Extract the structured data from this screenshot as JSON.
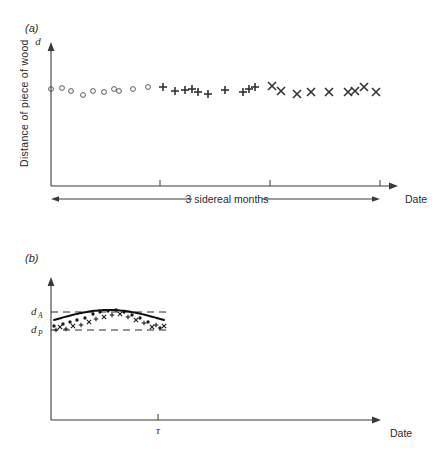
{
  "figure": {
    "background": "#ffffff",
    "ink_color": "#2b2b2b",
    "panel_a_tag": "(a)",
    "panel_b_tag": "(b)"
  },
  "panel_a": {
    "y_axis_symbol": "d",
    "y_axis_label": "Distance of piece of wood",
    "x_axis_label": "Date",
    "span_label": "3 sidereal months",
    "tick_count": 3
  },
  "panel_b": {
    "x_axis_label": "Date",
    "tau_label": "τ",
    "level_high_symbol": "d",
    "level_high_sub": "A",
    "level_low_symbol": "d",
    "level_low_sub": "P"
  },
  "chart_data": [
    {
      "type": "scatter",
      "panel": "(a)",
      "title": "",
      "xlabel": "Date",
      "ylabel": "Distance of piece of wood",
      "y_axis_symbol": "d",
      "grid": false,
      "legend": "none",
      "axis_note": "3 sidereal months",
      "xlim": [
        0,
        100
      ],
      "ylim": [
        0,
        100
      ],
      "xticks_px": [
        160,
        270,
        380
      ],
      "series": [
        {
          "name": "circles",
          "marker": "open-circle",
          "points": [
            {
              "x": 51,
              "y": 89
            },
            {
              "x": 62,
              "y": 88
            },
            {
              "x": 71,
              "y": 91
            },
            {
              "x": 83,
              "y": 95
            },
            {
              "x": 93,
              "y": 91
            },
            {
              "x": 104,
              "y": 92
            },
            {
              "x": 114,
              "y": 89
            },
            {
              "x": 119,
              "y": 91
            },
            {
              "x": 133,
              "y": 89
            },
            {
              "x": 148,
              "y": 87
            }
          ]
        },
        {
          "name": "pluses",
          "marker": "plus",
          "points": [
            {
              "x": 163,
              "y": 87
            },
            {
              "x": 175,
              "y": 91
            },
            {
              "x": 185,
              "y": 90
            },
            {
              "x": 192,
              "y": 89
            },
            {
              "x": 198,
              "y": 92
            },
            {
              "x": 208,
              "y": 94
            },
            {
              "x": 225,
              "y": 90
            },
            {
              "x": 243,
              "y": 92
            },
            {
              "x": 249,
              "y": 89
            },
            {
              "x": 255,
              "y": 87
            }
          ]
        },
        {
          "name": "crosses",
          "marker": "cross",
          "points": [
            {
              "x": 272,
              "y": 86
            },
            {
              "x": 281,
              "y": 91
            },
            {
              "x": 297,
              "y": 94
            },
            {
              "x": 311,
              "y": 92
            },
            {
              "x": 329,
              "y": 92
            },
            {
              "x": 348,
              "y": 92
            },
            {
              "x": 355,
              "y": 91
            },
            {
              "x": 364,
              "y": 87
            },
            {
              "x": 376,
              "y": 92
            }
          ]
        }
      ]
    },
    {
      "type": "scatter",
      "panel": "(b)",
      "title": "",
      "xlabel": "Date",
      "ylabel": "",
      "grid": false,
      "legend": "none",
      "reference_lines": [
        {
          "label": "d_A",
          "role": "apogee-level",
          "style": "dashed"
        },
        {
          "label": "d_P",
          "role": "perigee-level",
          "style": "dashed"
        }
      ],
      "x_marker": "τ",
      "fit_curve": "sinusoidal, rising from d_P to d_A then falling back to d_P",
      "scatter_points": [
        {
          "x": 54,
          "y": 326,
          "m": "dot"
        },
        {
          "x": 56,
          "y": 330,
          "m": "plus"
        },
        {
          "x": 60,
          "y": 327,
          "m": "cross"
        },
        {
          "x": 63,
          "y": 324,
          "m": "dot"
        },
        {
          "x": 66,
          "y": 329,
          "m": "plus"
        },
        {
          "x": 70,
          "y": 322,
          "m": "dot"
        },
        {
          "x": 73,
          "y": 326,
          "m": "cross"
        },
        {
          "x": 77,
          "y": 320,
          "m": "dot"
        },
        {
          "x": 81,
          "y": 325,
          "m": "plus"
        },
        {
          "x": 85,
          "y": 318,
          "m": "dot"
        },
        {
          "x": 89,
          "y": 322,
          "m": "cross"
        },
        {
          "x": 93,
          "y": 314,
          "m": "dot"
        },
        {
          "x": 96,
          "y": 319,
          "m": "plus"
        },
        {
          "x": 100,
          "y": 312,
          "m": "dot"
        },
        {
          "x": 104,
          "y": 317,
          "m": "cross"
        },
        {
          "x": 108,
          "y": 311,
          "m": "dot"
        },
        {
          "x": 112,
          "y": 315,
          "m": "plus"
        },
        {
          "x": 116,
          "y": 310,
          "m": "dot"
        },
        {
          "x": 120,
          "y": 314,
          "m": "cross"
        },
        {
          "x": 124,
          "y": 312,
          "m": "dot"
        },
        {
          "x": 128,
          "y": 317,
          "m": "plus"
        },
        {
          "x": 132,
          "y": 315,
          "m": "dot"
        },
        {
          "x": 136,
          "y": 320,
          "m": "cross"
        },
        {
          "x": 140,
          "y": 318,
          "m": "dot"
        },
        {
          "x": 144,
          "y": 323,
          "m": "plus"
        },
        {
          "x": 148,
          "y": 322,
          "m": "dot"
        },
        {
          "x": 152,
          "y": 327,
          "m": "cross"
        },
        {
          "x": 156,
          "y": 325,
          "m": "plus"
        },
        {
          "x": 160,
          "y": 328,
          "m": "dot"
        },
        {
          "x": 164,
          "y": 326,
          "m": "cross"
        }
      ]
    }
  ]
}
